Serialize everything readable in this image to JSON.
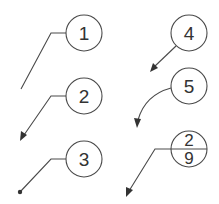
{
  "diagram": {
    "type": "balloon-callout-styles",
    "colors": {
      "line": "#4a4a4a",
      "text": "#333333",
      "background": "#ffffff"
    },
    "balloons": [
      {
        "id": "1",
        "label": "1",
        "leader": "shoulder-plain-end"
      },
      {
        "id": "2",
        "label": "2",
        "leader": "shoulder-arrow-end"
      },
      {
        "id": "3",
        "label": "3",
        "leader": "shoulder-dot-end"
      },
      {
        "id": "4",
        "label": "4",
        "leader": "straight-arrow"
      },
      {
        "id": "5",
        "label": "5",
        "leader": "curved-arrow"
      },
      {
        "id": "split",
        "top": "2",
        "bottom": "9",
        "leader": "split-line-arrow"
      }
    ]
  }
}
